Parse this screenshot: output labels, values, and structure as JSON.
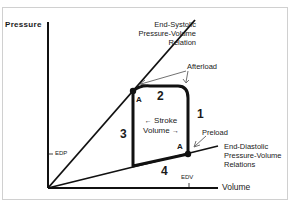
{
  "diagram": {
    "axes": {
      "y_label": "Pressure",
      "x_label": "Volume",
      "y_tick": "EDP",
      "x_tick": "EDV"
    },
    "curves": {
      "espvr": {
        "label_line1": "End-Systolic",
        "label_line2": "Pressure-Volume",
        "label_line3": "Relation"
      },
      "edpvr": {
        "label_line1": "End-Diastolic",
        "label_line2": "Pressure-Volume",
        "label_line3": "Relations"
      }
    },
    "annotations": {
      "afterload": "Afterload",
      "preload": "Preload",
      "stroke_volume_line1": "Stroke",
      "stroke_volume_line2": "Volume",
      "arrow_left": "←",
      "arrow_right": "→"
    },
    "points": {
      "top_left": "A",
      "bottom_right": "A"
    },
    "phases": {
      "phase1": "1",
      "phase2": "2",
      "phase3": "3",
      "phase4": "4"
    },
    "colors": {
      "line": "#111111",
      "text": "#1a1a1a",
      "frame": "#d0d0d0"
    }
  }
}
